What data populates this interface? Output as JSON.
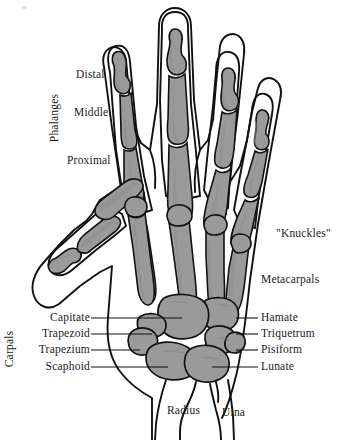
{
  "figure": {
    "type": "anatomical-diagram",
    "background": "#ffffff",
    "bone_fill": "#9a9a9a",
    "bone_fill_light": "#b0b0b0",
    "outline_color": "#111111",
    "skin_outline_color": "#111111",
    "text_color": "#1a1a1a"
  },
  "labels": {
    "left": [
      {
        "text": "Distal",
        "x": 76,
        "y": 74,
        "leader": false
      },
      {
        "text": "Middle",
        "x": 74,
        "y": 112,
        "leader": false
      },
      {
        "text": "Proximal",
        "x": 67,
        "y": 160,
        "leader": false
      }
    ],
    "left_group": {
      "text": "Phalanges",
      "x": 62,
      "y": 118
    },
    "carpal_group": {
      "text": "Carpals",
      "x": 9,
      "y": 350
    },
    "carpals_left": [
      {
        "text": "Capitate",
        "x": 38,
        "y": 318,
        "leader_x": 91,
        "leader_w": 53
      },
      {
        "text": "Trapezoid",
        "x": 31,
        "y": 334,
        "leader_x": 91,
        "leader_w": 47
      },
      {
        "text": "Trapezium",
        "x": 28,
        "y": 350,
        "leader_x": 91,
        "leader_w": 42
      },
      {
        "text": "Scaphoid",
        "x": 38,
        "y": 367,
        "leader_x": 91,
        "leader_w": 56
      }
    ],
    "right": [
      {
        "text": "\"Knuckles\"",
        "x": 276,
        "y": 234,
        "leader": false
      },
      {
        "text": "Metacarpals",
        "x": 261,
        "y": 280,
        "leader": false
      }
    ],
    "carpals_right": [
      {
        "text": "Hamate",
        "x": 261,
        "y": 318,
        "leader_x": 239,
        "leader_w": 20
      },
      {
        "text": "Triquetrum",
        "x": 261,
        "y": 334,
        "leader_x": 239,
        "leader_w": 20
      },
      {
        "text": "Pisiform",
        "x": 261,
        "y": 350,
        "leader_x": 239,
        "leader_w": 20
      },
      {
        "text": "Lunate",
        "x": 261,
        "y": 367,
        "leader_x": 214,
        "leader_w": 45
      }
    ],
    "bottom": [
      {
        "text": "Radius",
        "x": 167,
        "y": 411
      },
      {
        "text": "Ulna",
        "x": 222,
        "y": 413
      }
    ]
  }
}
